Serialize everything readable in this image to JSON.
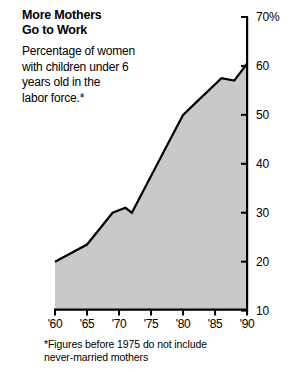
{
  "title": "More Mothers\nGo to Work",
  "subtitle": "Percentage of women\nwith children under 6\nyears old in the\nlabor force.*",
  "footnote": "*Figures before 1975 do not include\nnever-married mothers",
  "colors": {
    "area_fill": "#c9c9c9",
    "line": "#000000",
    "axis": "#000000",
    "background": "#ffffff",
    "text": "#000000"
  },
  "chart_data": {
    "type": "area",
    "title": "More Mothers Go to Work",
    "subtitle": "Percentage of women with children under 6 years old in the labor force.*",
    "xlabel": "",
    "ylabel": "70%",
    "xlim": [
      1960,
      1990
    ],
    "ylim": [
      10,
      70
    ],
    "grid": false,
    "legend": null,
    "y_axis_position": "right",
    "y_unit": "percent",
    "y_ticks": [
      70,
      60,
      50,
      40,
      30,
      20,
      10
    ],
    "y_tick_labels": [
      "70%",
      "60",
      "50",
      "40",
      "30",
      "20",
      "10"
    ],
    "x_ticks": [
      1960,
      1965,
      1970,
      1975,
      1980,
      1985,
      1990
    ],
    "x_tick_labels": [
      "'60",
      "'65",
      "'70",
      "'75",
      "'80",
      "'85",
      "'90"
    ],
    "x": [
      1960,
      1965,
      1969,
      1971,
      1972,
      1975,
      1978,
      1980,
      1982,
      1986,
      1988,
      1990
    ],
    "values": [
      20.0,
      23.5,
      30.0,
      31.0,
      30.0,
      37.5,
      45.0,
      50.0,
      52.5,
      57.5,
      57.0,
      60.5
    ],
    "series": [
      {
        "name": "Percentage of women with children under 6 in the labor force",
        "values": [
          20.0,
          23.5,
          30.0,
          31.0,
          30.0,
          37.5,
          45.0,
          50.0,
          52.5,
          57.5,
          57.0,
          60.5
        ]
      }
    ],
    "annotations": [
      "*Figures before 1975 do not include never-married mothers"
    ]
  }
}
